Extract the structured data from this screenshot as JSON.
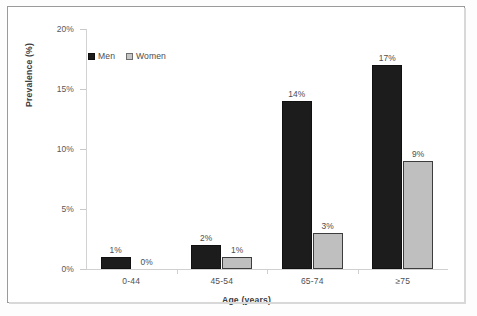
{
  "chart_data": {
    "type": "bar",
    "title": "",
    "xlabel": "Age (years)",
    "ylabel": "Prevalence (%)",
    "categories": [
      "0-44",
      "45-54",
      "65-74",
      "≥75"
    ],
    "series": [
      {
        "name": "Men",
        "values": [
          1,
          2,
          14,
          17
        ],
        "color": "#1c1c1c",
        "labels": [
          "1%",
          "2%",
          "14%",
          "17%"
        ]
      },
      {
        "name": "Women",
        "values": [
          0,
          1,
          3,
          9
        ],
        "color": "#bfbfbf",
        "labels": [
          "0%",
          "1%",
          "3%",
          "9%"
        ]
      }
    ],
    "ylim": [
      0,
      20
    ],
    "yticks": [
      0,
      5,
      10,
      15,
      20
    ],
    "ytick_labels": [
      "0%",
      "5%",
      "10%",
      "15%",
      "20%"
    ],
    "grid": false,
    "legend_position": "top-left-inside",
    "value_label_suffix": "%"
  },
  "legend": {
    "items": [
      {
        "label": "Men",
        "swatch": "black-square-icon"
      },
      {
        "label": "Women",
        "swatch": "gray-square-icon"
      }
    ]
  }
}
